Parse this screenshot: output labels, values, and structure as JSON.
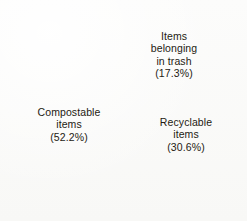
{
  "chart_data": {
    "type": "pie",
    "title": "",
    "subtitle": "",
    "xlabel": "",
    "ylabel": "",
    "grid": false,
    "legend_position": "none",
    "labels_inside_slices": true,
    "start_angle_deg": 0,
    "direction": "clockwise",
    "total_percent": 100.1,
    "categories": [
      "Items belonging in trash",
      "Recyclable items",
      "Compostable items"
    ],
    "values": [
      17.3,
      30.6,
      52.2
    ],
    "slices": [
      {
        "name": "Items belonging in trash",
        "label_line1": "Items",
        "label_line2": "belonging",
        "label_line3": "in trash",
        "value": 17.3,
        "value_text": "(17.3%)",
        "full_label": "Items\nbelonging\nin trash\n(17.3%)",
        "color": "#e8581f",
        "start_angle_deg": 0,
        "end_angle_deg": 62.3
      },
      {
        "name": "Recyclable items",
        "label_line1": "Recyclable",
        "label_line2": "items",
        "value": 30.6,
        "value_text": "(30.6%)",
        "full_label": "Recyclable\nitems\n(30.6%)",
        "color": "#4a72be",
        "start_angle_deg": 62.3,
        "end_angle_deg": 172.4
      },
      {
        "name": "Compostable items",
        "label_line1": "Compostable",
        "label_line2": "items",
        "value": 52.2,
        "value_text": "(52.2%)",
        "full_label": "Compostable\nitems\n(52.2%)",
        "color": "#7fa528",
        "start_angle_deg": 172.4,
        "end_angle_deg": 360
      }
    ]
  },
  "geometry": {
    "center_x": 131,
    "center_y": 109,
    "radius": 106
  },
  "colors": {
    "background": "#fbfbfa",
    "trash_orange": "#e8581f",
    "recyclable_blue": "#4a72be",
    "compostable_green": "#7fa528",
    "label_text": "#241a12"
  }
}
